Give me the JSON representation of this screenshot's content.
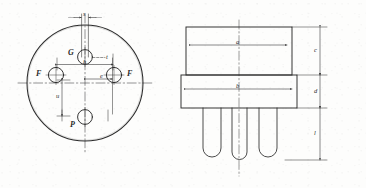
{
  "figure": {
    "type": "mechanical-drawing",
    "background_color": "#fdfdfc",
    "line_color": "#2b2b2b"
  },
  "top_view": {
    "name": "circular base top view",
    "outline_shape": "circle",
    "pins": [
      {
        "id": "pin-g",
        "label": "G",
        "position": "top"
      },
      {
        "id": "pin-f-left",
        "label": "F",
        "position": "left"
      },
      {
        "id": "pin-f-right",
        "label": "F",
        "position": "right"
      },
      {
        "id": "pin-p",
        "label": "P",
        "position": "bottom"
      }
    ],
    "dimensions": [
      {
        "id": "dim-s",
        "label": "s",
        "orientation": "horizontal",
        "where": "top"
      },
      {
        "id": "dim-t",
        "label": "t",
        "orientation": "horizontal",
        "where": "center-right-of-g"
      },
      {
        "id": "dim-h",
        "label": "h",
        "orientation": "horizontal",
        "where": "upper-middle"
      },
      {
        "id": "dim-e",
        "label": "e",
        "orientation": "horizontal",
        "where": "middle"
      },
      {
        "id": "dim-u",
        "label": "u",
        "orientation": "vertical",
        "where": "lower-left"
      }
    ]
  },
  "side_view": {
    "name": "side elevation view",
    "body_sections": [
      {
        "id": "upper-body",
        "shape": "rectangle"
      },
      {
        "id": "lower-flange",
        "shape": "rectangle-wide"
      }
    ],
    "leads": [
      {
        "id": "lead-1",
        "shape": "u-pin"
      },
      {
        "id": "lead-2",
        "shape": "u-pin"
      },
      {
        "id": "lead-3",
        "shape": "u-pin"
      }
    ],
    "dimensions": [
      {
        "id": "dim-a",
        "label": "a",
        "orientation": "horizontal",
        "where": "upper-body-width"
      },
      {
        "id": "dim-b",
        "label": "b",
        "orientation": "horizontal",
        "where": "flange-width"
      },
      {
        "id": "dim-c",
        "label": "c",
        "orientation": "vertical",
        "where": "upper-body-height"
      },
      {
        "id": "dim-d",
        "label": "d",
        "orientation": "vertical",
        "where": "flange-height"
      },
      {
        "id": "dim-l",
        "label": "l",
        "orientation": "vertical",
        "where": "lead-length"
      }
    ]
  }
}
